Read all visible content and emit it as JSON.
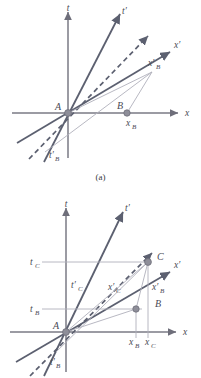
{
  "figure": {
    "panels": [
      {
        "id": "a",
        "caption": "(a)",
        "axes": {
          "t_label": "t",
          "x_label": "x",
          "t_prime_label": "t'",
          "x_prime_label": "x'"
        },
        "points": [
          {
            "name": "A",
            "label": "A"
          },
          {
            "name": "B",
            "label": "B"
          }
        ],
        "coordinate_labels": [
          {
            "name": "x-sub-B",
            "label": "x",
            "sub": "B"
          },
          {
            "name": "x-prime-sub-B",
            "label": "x'",
            "sub": "B"
          },
          {
            "name": "t-prime-sub-B",
            "label": "t'",
            "sub": "B"
          }
        ]
      },
      {
        "id": "b",
        "caption": "",
        "axes": {
          "t_label": "t",
          "x_label": "x",
          "t_prime_label": "t'",
          "x_prime_label": "x'"
        },
        "points": [
          {
            "name": "A",
            "label": "A"
          },
          {
            "name": "B",
            "label": "B"
          },
          {
            "name": "C",
            "label": "C"
          }
        ],
        "coordinate_labels": [
          {
            "name": "t-sub-C",
            "label": "t",
            "sub": "C"
          },
          {
            "name": "t-sub-B",
            "label": "t",
            "sub": "B"
          },
          {
            "name": "t-prime-sub-C",
            "label": "t'",
            "sub": "C"
          },
          {
            "name": "t-prime-sub-B",
            "label": "t'",
            "sub": "B"
          },
          {
            "name": "x-prime-sub-C",
            "label": "x'",
            "sub": "C"
          },
          {
            "name": "x-prime-sub-B",
            "label": "x'",
            "sub": "B"
          },
          {
            "name": "x-sub-B",
            "label": "x",
            "sub": "B"
          },
          {
            "name": "x-sub-C",
            "label": "x",
            "sub": "C"
          }
        ]
      }
    ],
    "colors": {
      "axis": "#7a7a85",
      "worldline": "#5c6070",
      "construction": "#a9a9b4",
      "point_fill": "#8e8e99",
      "text": "#4a4a55"
    }
  },
  "labels": {
    "t": "t",
    "x": "x",
    "t_prime": "t′",
    "x_prime": "x′",
    "A": "A",
    "B": "B",
    "C": "C",
    "sub_B": "B",
    "sub_C": "C",
    "caption_a": "(a)"
  }
}
